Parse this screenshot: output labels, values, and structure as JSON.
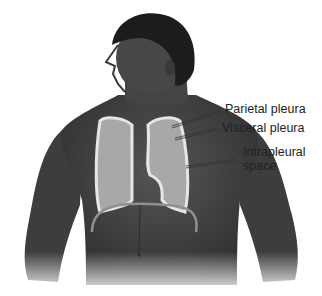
{
  "figure": {
    "labels": {
      "parietal_pleura": "Parietal pleura",
      "visceral_pleura": "Visceral pleura",
      "intrapleural_line1": "Intrapleural",
      "intrapleural_line2": "space"
    },
    "colors": {
      "skin": "#4a4a4a",
      "skin_dark": "#2e2e2e",
      "hair": "#1a1a1a",
      "lung": "#a8a8a8",
      "pleura": "#e6e6e6",
      "diaphragm": "#9a9a9a",
      "leader": "#333333"
    }
  }
}
